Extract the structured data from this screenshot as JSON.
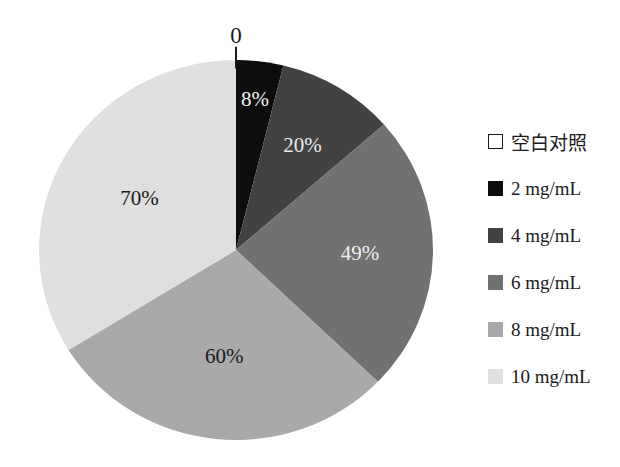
{
  "page": {
    "background": "#ffffff"
  },
  "chart_data": {
    "type": "pie",
    "title": "",
    "start_angle_deg": 0,
    "direction": "clockwise",
    "legend_position": "right",
    "total_of_values": 207,
    "slices": [
      {
        "label": "空白对照",
        "value": 0,
        "display": "0",
        "color": "#ffffff",
        "swatch_border": "#1a1a1a",
        "label_color": "#1a1a1a",
        "label_r": 1.13
      },
      {
        "label": "2 mg/mL",
        "value": 8,
        "display": "8%",
        "color": "#0d0d0d",
        "label_color": "#f2f2f2",
        "label_r": 0.8
      },
      {
        "label": "4 mg/mL",
        "value": 20,
        "display": "20%",
        "color": "#424242",
        "label_color": "#e8e8e8",
        "label_r": 0.65
      },
      {
        "label": "6 mg/mL",
        "value": 49,
        "display": "49%",
        "color": "#717171",
        "label_color": "#efefef",
        "label_r": 0.63
      },
      {
        "label": "8 mg/mL",
        "value": 60,
        "display": "60%",
        "color": "#a9a9a9",
        "label_color": "#1a1a1a",
        "label_r": 0.56
      },
      {
        "label": "10 mg/mL",
        "value": 70,
        "display": "70%",
        "color": "#dfdfdf",
        "label_color": "#1a1a1a",
        "label_r": 0.56
      }
    ]
  }
}
